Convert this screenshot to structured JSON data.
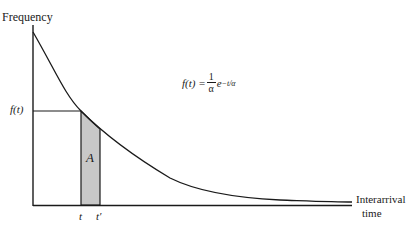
{
  "diagram": {
    "y_axis_label": "Frequency",
    "x_axis_label_line1": "Interarrival",
    "x_axis_label_line2": "time",
    "y_tick_label": "f(t)",
    "x_tick_t": "t",
    "x_tick_t_prime": "t′",
    "area_label": "A",
    "formula": {
      "lhs": "f(t) =",
      "numerator": "1",
      "denominator": "α",
      "base": "e",
      "exponent": "−t/α"
    },
    "colors": {
      "line": "#1a1a1a",
      "shaded_area": "#c8c8c8"
    }
  }
}
